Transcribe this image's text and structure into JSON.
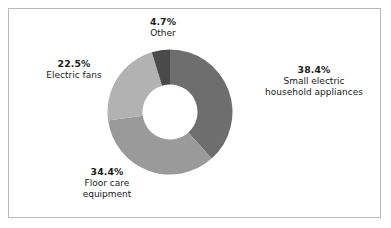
{
  "figure": {
    "background_color": "#ffffff",
    "frame_color": "#b9b9b9"
  },
  "chart_data": {
    "type": "pie",
    "variant": "donut",
    "title": "",
    "subtitle": "",
    "xlabel": "",
    "ylabel": "",
    "legend_position": "none",
    "grid": false,
    "start_angle_deg": 0,
    "direction": "clockwise",
    "hole_ratio": 0.44,
    "value_unit": "%",
    "categories": [
      "Small electric household appliances",
      "Floor care equipment",
      "Electric fans",
      "Other"
    ],
    "values": [
      38.4,
      34.4,
      22.5,
      4.7
    ],
    "colors": [
      "#6e6e6e",
      "#9a9a9a",
      "#b2b2b2",
      "#4a4a4a"
    ],
    "slices": [
      {
        "id": "small-electric",
        "percent_label": "38.4%",
        "value": 38.4,
        "name_line1": "Small electric",
        "name_line2": "household appliances",
        "color": "#6e6e6e"
      },
      {
        "id": "floor-care",
        "percent_label": "34.4%",
        "value": 34.4,
        "name_line1": "Floor care",
        "name_line2": "equipment",
        "color": "#9a9a9a"
      },
      {
        "id": "electric-fans",
        "percent_label": "22.5%",
        "value": 22.5,
        "name_line1": "Electric fans",
        "name_line2": "",
        "color": "#b2b2b2"
      },
      {
        "id": "other",
        "percent_label": "4.7%",
        "value": 4.7,
        "name_line1": "Other",
        "name_line2": "",
        "color": "#4a4a4a"
      }
    ]
  }
}
